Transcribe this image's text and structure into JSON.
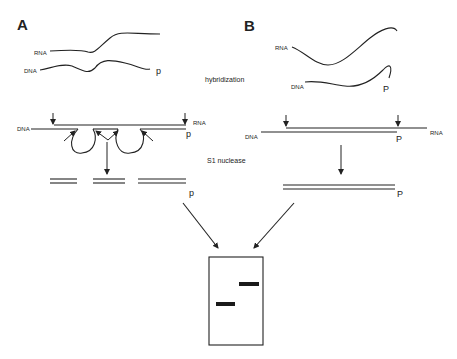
{
  "panels": {
    "a": {
      "label": "A"
    },
    "b": {
      "label": "B"
    }
  },
  "labels": {
    "rna": "RNA",
    "dna": "DNA",
    "p": "p",
    "P": "P"
  },
  "steps": {
    "hybridization": "hybridization",
    "s1_nuclease": "S1 nuclease"
  },
  "gel": {
    "bands": [
      {
        "position": "upper-right",
        "source": "B"
      },
      {
        "position": "lower-left",
        "source": "A"
      }
    ]
  },
  "colors": {
    "ink": "#222222",
    "background": "#ffffff"
  }
}
